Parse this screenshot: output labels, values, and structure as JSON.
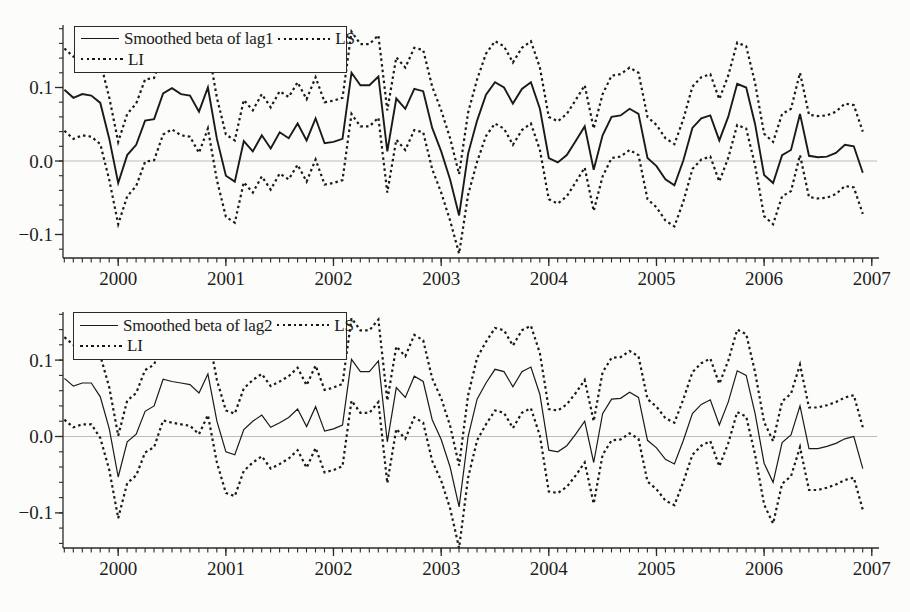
{
  "figure": {
    "colors": {
      "line": "#1a1a1a",
      "text": "#1e1e1e",
      "frame": "#2a2a2a",
      "zero_line": "#bcbcba",
      "background": "#fcfcfa"
    }
  },
  "chart_data": [
    {
      "type": "line",
      "title": "",
      "panel": "top",
      "legend": {
        "series_label": "Smoothed beta of lag1",
        "ls_label": "LS",
        "li_label": "LI"
      },
      "x_start": 1999.5,
      "x_step": 0.0833333,
      "xlim": [
        1999.487,
        2007.03
      ],
      "ylim": [
        -0.132,
        0.185
      ],
      "x_major_ticks": [
        2000,
        2001,
        2002,
        2003,
        2004,
        2005,
        2006,
        2007
      ],
      "x_tick_labels": [
        "2000",
        "2001",
        "2002",
        "2003",
        "2004",
        "2005",
        "2006",
        "2007"
      ],
      "x_minor_step": 0.0833333,
      "y_major_ticks": [
        0.1,
        0.0,
        -0.1
      ],
      "y_tick_labels": [
        "0.1",
        "0.0",
        "−0.1"
      ],
      "y_minor_step": 0.02,
      "grid": "zero-line-only",
      "legend_position": "top-left-inside",
      "series": [
        {
          "name": "Smoothed beta of lag1",
          "style": "solid",
          "values": [
            0.097,
            0.086,
            0.091,
            0.089,
            0.079,
            0.03,
            -0.03,
            0.008,
            0.022,
            0.055,
            0.057,
            0.092,
            0.099,
            0.091,
            0.089,
            0.067,
            0.1,
            0.03,
            -0.02,
            -0.028,
            0.027,
            0.013,
            0.035,
            0.017,
            0.039,
            0.031,
            0.051,
            0.028,
            0.058,
            0.024,
            0.026,
            0.03,
            0.12,
            0.103,
            0.103,
            0.115,
            0.013,
            0.085,
            0.071,
            0.098,
            0.095,
            0.045,
            0.013,
            -0.025,
            -0.074,
            0.01,
            0.055,
            0.09,
            0.107,
            0.1,
            0.078,
            0.098,
            0.107,
            0.071,
            0.004,
            -0.002,
            0.008,
            0.027,
            0.047,
            -0.012,
            0.035,
            0.06,
            0.062,
            0.071,
            0.064,
            0.004,
            -0.007,
            -0.025,
            -0.033,
            0.001,
            0.045,
            0.058,
            0.062,
            0.028,
            0.06,
            0.105,
            0.1,
            0.05,
            -0.019,
            -0.03,
            0.008,
            0.015,
            0.064,
            0.007,
            0.005,
            0.006,
            0.011,
            0.022,
            0.02,
            -0.016
          ]
        },
        {
          "name": "LS",
          "style": "dotted",
          "values": [
            0.153,
            0.142,
            0.147,
            0.145,
            0.135,
            0.086,
            0.026,
            0.064,
            0.078,
            0.111,
            0.113,
            0.148,
            0.155,
            0.147,
            0.145,
            0.123,
            0.156,
            0.086,
            0.036,
            0.028,
            0.083,
            0.069,
            0.091,
            0.073,
            0.095,
            0.087,
            0.107,
            0.084,
            0.114,
            0.08,
            0.082,
            0.086,
            0.176,
            0.159,
            0.159,
            0.171,
            0.069,
            0.141,
            0.127,
            0.154,
            0.151,
            0.101,
            0.069,
            0.031,
            -0.018,
            0.066,
            0.111,
            0.146,
            0.163,
            0.156,
            0.134,
            0.154,
            0.163,
            0.127,
            0.06,
            0.054,
            0.064,
            0.083,
            0.103,
            0.044,
            0.091,
            0.116,
            0.118,
            0.127,
            0.12,
            0.06,
            0.049,
            0.031,
            0.023,
            0.057,
            0.101,
            0.114,
            0.118,
            0.084,
            0.116,
            0.161,
            0.156,
            0.106,
            0.037,
            0.026,
            0.064,
            0.071,
            0.12,
            0.063,
            0.061,
            0.062,
            0.067,
            0.078,
            0.076,
            0.04
          ]
        },
        {
          "name": "LI",
          "style": "dotted",
          "values": [
            0.041,
            0.03,
            0.035,
            0.033,
            0.023,
            -0.026,
            -0.086,
            -0.048,
            -0.034,
            -0.001,
            0.001,
            0.036,
            0.043,
            0.035,
            0.033,
            0.011,
            0.044,
            -0.026,
            -0.076,
            -0.084,
            -0.029,
            -0.043,
            -0.021,
            -0.039,
            -0.017,
            -0.025,
            -0.005,
            -0.028,
            0.002,
            -0.032,
            -0.03,
            -0.026,
            0.064,
            0.047,
            0.047,
            0.059,
            -0.043,
            0.029,
            0.015,
            0.042,
            0.039,
            -0.011,
            -0.043,
            -0.081,
            -0.126,
            -0.046,
            -0.001,
            0.034,
            0.051,
            0.044,
            0.022,
            0.042,
            0.051,
            0.015,
            -0.052,
            -0.058,
            -0.048,
            -0.029,
            -0.009,
            -0.068,
            -0.021,
            0.004,
            0.006,
            0.015,
            0.008,
            -0.052,
            -0.063,
            -0.081,
            -0.089,
            -0.055,
            -0.011,
            0.002,
            0.006,
            -0.028,
            0.004,
            0.049,
            0.044,
            -0.006,
            -0.075,
            -0.086,
            -0.048,
            -0.041,
            0.008,
            -0.049,
            -0.051,
            -0.05,
            -0.045,
            -0.034,
            -0.036,
            -0.072
          ]
        }
      ]
    },
    {
      "type": "line",
      "title": "",
      "panel": "bottom",
      "legend": {
        "series_label": "Smoothed beta of lag2",
        "ls_label": "LS",
        "li_label": "LI"
      },
      "x_start": 1999.5,
      "x_step": 0.0833333,
      "xlim": [
        1999.487,
        2007.03
      ],
      "ylim": [
        -0.146,
        0.163
      ],
      "x_major_ticks": [
        2000,
        2001,
        2002,
        2003,
        2004,
        2005,
        2006,
        2007
      ],
      "x_tick_labels": [
        "2000",
        "2001",
        "2002",
        "2003",
        "2004",
        "2005",
        "2006",
        "2007"
      ],
      "x_minor_step": 0.0833333,
      "y_major_ticks": [
        0.1,
        0.0,
        -0.1
      ],
      "y_tick_labels": [
        "0.1",
        "0.0",
        "−0.1"
      ],
      "y_minor_step": 0.02,
      "grid": "zero-line-only",
      "legend_position": "top-left-inside",
      "series": [
        {
          "name": "Smoothed beta of lag2",
          "style": "solid",
          "values": [
            0.076,
            0.066,
            0.07,
            0.07,
            0.052,
            0.01,
            -0.053,
            -0.007,
            0.003,
            0.033,
            0.04,
            0.075,
            0.072,
            0.07,
            0.068,
            0.057,
            0.082,
            0.02,
            -0.02,
            -0.024,
            0.009,
            0.02,
            0.028,
            0.012,
            0.018,
            0.025,
            0.036,
            0.013,
            0.039,
            0.007,
            0.01,
            0.015,
            0.101,
            0.085,
            0.085,
            0.099,
            -0.007,
            0.064,
            0.051,
            0.079,
            0.072,
            0.022,
            -0.004,
            -0.04,
            -0.092,
            0.0,
            0.049,
            0.07,
            0.088,
            0.085,
            0.065,
            0.085,
            0.091,
            0.055,
            -0.018,
            -0.02,
            -0.012,
            0.003,
            0.02,
            -0.034,
            0.03,
            0.049,
            0.05,
            0.058,
            0.051,
            -0.005,
            -0.015,
            -0.03,
            -0.036,
            -0.005,
            0.03,
            0.042,
            0.048,
            0.015,
            0.045,
            0.086,
            0.08,
            0.03,
            -0.035,
            -0.06,
            -0.008,
            0.002,
            0.04,
            -0.016,
            -0.016,
            -0.013,
            -0.009,
            -0.003,
            0.0,
            -0.042
          ]
        },
        {
          "name": "LS",
          "style": "dotted",
          "values": [
            0.13,
            0.12,
            0.124,
            0.124,
            0.106,
            0.064,
            0.001,
            0.047,
            0.057,
            0.087,
            0.094,
            0.129,
            0.126,
            0.124,
            0.122,
            0.111,
            0.136,
            0.074,
            0.034,
            0.03,
            0.063,
            0.074,
            0.082,
            0.066,
            0.072,
            0.079,
            0.09,
            0.067,
            0.093,
            0.061,
            0.064,
            0.069,
            0.155,
            0.139,
            0.139,
            0.153,
            0.047,
            0.118,
            0.105,
            0.133,
            0.126,
            0.076,
            0.05,
            0.014,
            -0.038,
            0.054,
            0.103,
            0.124,
            0.142,
            0.139,
            0.119,
            0.139,
            0.145,
            0.109,
            0.036,
            0.034,
            0.042,
            0.057,
            0.074,
            0.02,
            0.084,
            0.103,
            0.104,
            0.112,
            0.105,
            0.049,
            0.039,
            0.024,
            0.018,
            0.049,
            0.084,
            0.096,
            0.102,
            0.069,
            0.099,
            0.14,
            0.134,
            0.084,
            0.019,
            -0.006,
            0.046,
            0.056,
            0.094,
            0.038,
            0.038,
            0.041,
            0.045,
            0.051,
            0.054,
            0.012
          ]
        },
        {
          "name": "LI",
          "style": "dotted",
          "values": [
            0.022,
            0.012,
            0.016,
            0.016,
            -0.002,
            -0.044,
            -0.107,
            -0.061,
            -0.051,
            -0.021,
            -0.014,
            0.021,
            0.018,
            0.016,
            0.014,
            0.003,
            0.028,
            -0.034,
            -0.074,
            -0.078,
            -0.045,
            -0.034,
            -0.026,
            -0.042,
            -0.036,
            -0.029,
            -0.018,
            -0.041,
            -0.015,
            -0.047,
            -0.044,
            -0.039,
            0.047,
            0.031,
            0.031,
            0.045,
            -0.061,
            0.01,
            -0.003,
            0.025,
            0.018,
            -0.032,
            -0.058,
            -0.094,
            -0.146,
            -0.054,
            -0.005,
            0.016,
            0.034,
            0.031,
            0.011,
            0.031,
            0.037,
            0.001,
            -0.072,
            -0.074,
            -0.066,
            -0.051,
            -0.034,
            -0.088,
            -0.024,
            -0.005,
            -0.004,
            0.004,
            -0.003,
            -0.059,
            -0.069,
            -0.084,
            -0.09,
            -0.059,
            -0.024,
            -0.012,
            -0.006,
            -0.039,
            -0.009,
            0.032,
            0.026,
            -0.024,
            -0.089,
            -0.114,
            -0.062,
            -0.052,
            -0.014,
            -0.07,
            -0.07,
            -0.067,
            -0.063,
            -0.057,
            -0.054,
            -0.096
          ]
        }
      ]
    }
  ]
}
